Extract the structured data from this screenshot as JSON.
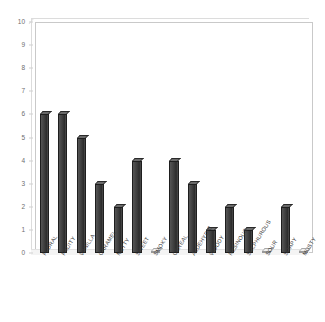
{
  "chart_data": {
    "type": "bar",
    "title": "",
    "subtitle": "",
    "xlabel": "",
    "ylabel": "",
    "ylim": [
      0,
      10
    ],
    "grid": false,
    "legend": null,
    "legend_position": "none",
    "y_ticks": [
      10,
      9,
      8,
      7,
      6,
      5,
      4,
      3,
      2,
      1,
      0
    ],
    "categories": [
      "FLORAL",
      "FRUITY",
      "VANILLA",
      "CARAMEL",
      "NUTTY",
      "SWEET",
      "SMOKY",
      "CEREAL",
      "ALDEHYDIC",
      "WOODY",
      "RESINOUS",
      "SULPHUROUS",
      "SOUR",
      "SOAPY",
      "MUSTY"
    ],
    "values": [
      6,
      6,
      5,
      3,
      2,
      4,
      0,
      4,
      3,
      1,
      2,
      1,
      0,
      2,
      0
    ],
    "bar_color": "#3a3a3a",
    "bar_edge_color": "#1e1e1e",
    "frame_color": "#c9c9c9",
    "background_color": "#ffffff",
    "axis_text_color": "#6e6e6e",
    "style": "3d-column"
  }
}
